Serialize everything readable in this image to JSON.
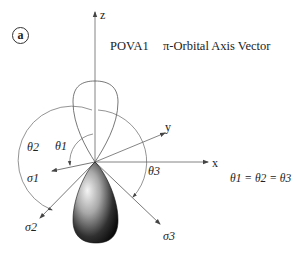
{
  "figure": {
    "panel_label": "a",
    "title_name": "POVA1",
    "title_desc": "π-Orbital Axis Vector",
    "equation": "θ1 = θ2 = θ3"
  },
  "axes": {
    "z": "z",
    "x": "x",
    "y": "y"
  },
  "vectors": {
    "sigma1": "σ1",
    "sigma2": "σ2",
    "sigma3": "σ3"
  },
  "angles": {
    "theta1": "θ1",
    "theta2": "θ2",
    "theta3": "θ3"
  },
  "colors": {
    "line": "#555555",
    "text": "#222222",
    "lobe_dark": "#000000",
    "lobe_light": "#f2f2f2"
  }
}
